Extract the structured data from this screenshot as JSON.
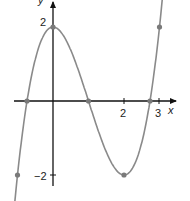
{
  "chart_data": {
    "type": "line",
    "title": "",
    "xlabel": "x",
    "ylabel": "y",
    "function": "y = x^3 - 3x^2 + 2",
    "x_ticks": [
      {
        "value": 2,
        "label": "2"
      },
      {
        "value": 3,
        "label": "3"
      }
    ],
    "y_ticks": [
      {
        "value": 2,
        "label": "2"
      },
      {
        "value": -2,
        "label": "−2"
      }
    ],
    "xlim": [
      -1.05,
      3.35
    ],
    "ylim": [
      -2.3,
      2.75
    ],
    "grid": false,
    "marked_points": [
      {
        "x": -1,
        "y": -2
      },
      {
        "x": -0.732,
        "y": 0
      },
      {
        "x": 0,
        "y": 2
      },
      {
        "x": 1,
        "y": 0
      },
      {
        "x": 2,
        "y": -2
      },
      {
        "x": 2.732,
        "y": 0
      },
      {
        "x": 3,
        "y": 2
      }
    ],
    "colors": {
      "curve": "#8a8a8a",
      "axes": "#111111",
      "points": "#7a7a7a"
    }
  },
  "labels": {
    "x_axis": "x",
    "y_axis": "y",
    "tick_x2": "2",
    "tick_x3": "3",
    "tick_y2": "2",
    "tick_yneg2": "−2"
  }
}
